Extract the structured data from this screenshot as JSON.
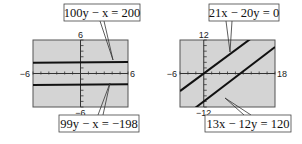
{
  "chart_data": [
    {
      "type": "line",
      "title": "",
      "xlim": [
        -6,
        6
      ],
      "ylim": [
        -6,
        6
      ],
      "xscale": 1,
      "yscale": 1,
      "tick_labels": {
        "xmin": "−6",
        "xmax": "6",
        "ymax": "6",
        "ymin": "−6"
      },
      "series": [
        {
          "name": "100y − x = 200",
          "equation": {
            "a": -1,
            "b": 100,
            "c": 200
          }
        },
        {
          "name": "99y − x = −198",
          "equation": {
            "a": -1,
            "b": 99,
            "c": -198
          }
        }
      ],
      "labels": {
        "top": "100y − x = 200",
        "bottom": "99y − x = −198"
      }
    },
    {
      "type": "line",
      "title": "",
      "xlim": [
        -6,
        18
      ],
      "ylim": [
        -12,
        12
      ],
      "xscale": 2,
      "yscale": 2,
      "tick_labels": {
        "xmin": "−6",
        "xmax": "18",
        "ymax": "12",
        "ymin": "−12"
      },
      "series": [
        {
          "name": "21x − 20y = 0",
          "equation": {
            "a": 21,
            "b": -20,
            "c": 0
          }
        },
        {
          "name": "13x − 12y = 120",
          "equation": {
            "a": 13,
            "b": -12,
            "c": 120
          }
        }
      ],
      "labels": {
        "top": "21x − 20y = 0",
        "bottom": "13x − 12y = 120"
      }
    }
  ],
  "colors": {
    "screen": "#d4d4d4",
    "line": "#111111",
    "frame": "#555555"
  }
}
